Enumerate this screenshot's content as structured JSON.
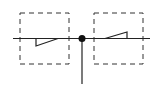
{
  "diagram": {
    "type": "structural-load-diagram",
    "colors": {
      "stroke": "#222222",
      "background": "#ffffff",
      "dash": "#333333"
    },
    "axis": {
      "x1": 13,
      "x2": 150,
      "y": 38.5
    },
    "support": {
      "cx": 82,
      "cy": 38.5,
      "r": 3.5,
      "stem_bottom": 84
    },
    "boxes": [
      {
        "id": "left-region",
        "x": 20,
        "y": 13,
        "w": 49,
        "h": 51
      },
      {
        "id": "right-region",
        "x": 94,
        "y": 13,
        "w": 49,
        "h": 51
      }
    ],
    "triangles": [
      {
        "id": "left-triangle",
        "points": "36,38.5 36,46 58,38.5"
      },
      {
        "id": "right-triangle",
        "points": "105,38.5 127,32 127,38.5"
      }
    ]
  }
}
